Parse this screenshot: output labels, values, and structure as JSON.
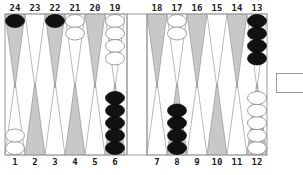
{
  "board": {
    "colors": {
      "background": "#ffffff",
      "frame": "#9a9a9a",
      "light_point": "#ffffff",
      "dark_point": "#c8c8c8",
      "black_checker": "#111111",
      "white_checker": "#ffffff"
    },
    "top_labels": [
      "24",
      "23",
      "22",
      "21",
      "20",
      "19",
      "18",
      "17",
      "16",
      "15",
      "14",
      "13"
    ],
    "bottom_labels": [
      "1",
      "2",
      "3",
      "4",
      "5",
      "6",
      "7",
      "8",
      "9",
      "10",
      "11",
      "12"
    ],
    "points": [
      {
        "point": 24,
        "color": "black",
        "count": 1
      },
      {
        "point": 23,
        "color": null,
        "count": 0
      },
      {
        "point": 22,
        "color": "black",
        "count": 1
      },
      {
        "point": 21,
        "color": "white",
        "count": 2
      },
      {
        "point": 20,
        "color": null,
        "count": 0
      },
      {
        "point": 19,
        "color": "white",
        "count": 4
      },
      {
        "point": 18,
        "color": null,
        "count": 0
      },
      {
        "point": 17,
        "color": "white",
        "count": 2
      },
      {
        "point": 16,
        "color": null,
        "count": 0
      },
      {
        "point": 15,
        "color": null,
        "count": 0
      },
      {
        "point": 14,
        "color": null,
        "count": 0
      },
      {
        "point": 13,
        "color": "black",
        "count": 4
      },
      {
        "point": 1,
        "color": "white",
        "count": 2
      },
      {
        "point": 2,
        "color": null,
        "count": 0
      },
      {
        "point": 3,
        "color": null,
        "count": 0
      },
      {
        "point": 4,
        "color": null,
        "count": 0
      },
      {
        "point": 5,
        "color": null,
        "count": 0
      },
      {
        "point": 6,
        "color": "black",
        "count": 5
      },
      {
        "point": 7,
        "color": null,
        "count": 0
      },
      {
        "point": 8,
        "color": "black",
        "count": 4
      },
      {
        "point": 9,
        "color": null,
        "count": 0
      },
      {
        "point": 10,
        "color": null,
        "count": 0
      },
      {
        "point": 11,
        "color": null,
        "count": 0
      },
      {
        "point": 12,
        "color": "white",
        "count": 5
      }
    ]
  },
  "doubling_cube": {
    "value": ""
  }
}
